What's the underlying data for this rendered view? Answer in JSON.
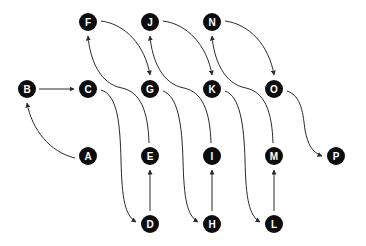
{
  "diagram": {
    "node_radius": 9,
    "node_color": "#0d0d0d",
    "label_color": "#ffffff",
    "edge_color": "#2a2a2a",
    "nodes": [
      {
        "id": "A",
        "label": "A",
        "x": 88,
        "y": 156
      },
      {
        "id": "B",
        "label": "B",
        "x": 27,
        "y": 89
      },
      {
        "id": "C",
        "label": "C",
        "x": 88,
        "y": 89
      },
      {
        "id": "D",
        "label": "D",
        "x": 150,
        "y": 224
      },
      {
        "id": "E",
        "label": "E",
        "x": 150,
        "y": 156
      },
      {
        "id": "F",
        "label": "F",
        "x": 88,
        "y": 22
      },
      {
        "id": "G",
        "label": "G",
        "x": 150,
        "y": 89
      },
      {
        "id": "H",
        "label": "H",
        "x": 212,
        "y": 224
      },
      {
        "id": "I",
        "label": "I",
        "x": 212,
        "y": 156
      },
      {
        "id": "J",
        "label": "J",
        "x": 150,
        "y": 22
      },
      {
        "id": "K",
        "label": "K",
        "x": 212,
        "y": 89
      },
      {
        "id": "L",
        "label": "L",
        "x": 274,
        "y": 224
      },
      {
        "id": "M",
        "label": "M",
        "x": 274,
        "y": 156
      },
      {
        "id": "N",
        "label": "N",
        "x": 212,
        "y": 22
      },
      {
        "id": "O",
        "label": "O",
        "x": 274,
        "y": 89
      },
      {
        "id": "P",
        "label": "P",
        "x": 336,
        "y": 156
      }
    ],
    "edges": [
      {
        "from": "A",
        "to": "B",
        "path": "M 75 158 C 50 152, 32 130, 27 103"
      },
      {
        "from": "B",
        "to": "C",
        "path": "M 39 89 L 74 89"
      },
      {
        "from": "C",
        "to": "D",
        "path": "M 101 90 C 118 95, 120 125, 121 160 C 122 200, 125 215, 136 222"
      },
      {
        "from": "D",
        "to": "E",
        "path": "M 150 211 L 150 170"
      },
      {
        "from": "E",
        "to": "F",
        "path": "M 149 143 C 148 110, 140 92, 122 88 C 100 84, 90 60, 88 36"
      },
      {
        "from": "F",
        "to": "G",
        "path": "M 101 21 C 125 24, 145 45, 150 75"
      },
      {
        "from": "G",
        "to": "H",
        "path": "M 163 91 C 178 96, 182 125, 183 160 C 184 200, 187 215, 198 222"
      },
      {
        "from": "H",
        "to": "I",
        "path": "M 212 211 L 212 170"
      },
      {
        "from": "I",
        "to": "J",
        "path": "M 211 143 C 210 110, 202 92, 184 88 C 162 84, 152 60, 150 36"
      },
      {
        "from": "J",
        "to": "K",
        "path": "M 163 21 C 187 24, 207 45, 212 75"
      },
      {
        "from": "K",
        "to": "L",
        "path": "M 225 91 C 240 96, 244 125, 245 160 C 246 200, 249 215, 260 222"
      },
      {
        "from": "L",
        "to": "M",
        "path": "M 274 211 L 274 170"
      },
      {
        "from": "M",
        "to": "N",
        "path": "M 273 143 C 272 110, 264 92, 246 88 C 224 84, 214 60, 212 36"
      },
      {
        "from": "N",
        "to": "O",
        "path": "M 225 21 C 249 24, 269 45, 274 75"
      },
      {
        "from": "O",
        "to": "P",
        "path": "M 287 91 C 302 96, 303 115, 305 130 C 308 145, 312 152, 322 156"
      }
    ]
  }
}
